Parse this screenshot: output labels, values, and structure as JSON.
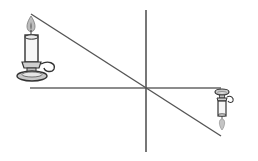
{
  "diagram": {
    "type": "pinhole-camera-inversion",
    "colors": {
      "line": "#555555",
      "outline": "#333333",
      "fill_light": "#f4f4f4",
      "fill_shadow": "#bdbdbd",
      "flame": "#b8b8b8"
    },
    "elements": {
      "object": "candle-upright",
      "image": "candle-inverted",
      "screen": "vertical-line",
      "axis": "horizontal-line",
      "ray": "diagonal-line"
    }
  }
}
